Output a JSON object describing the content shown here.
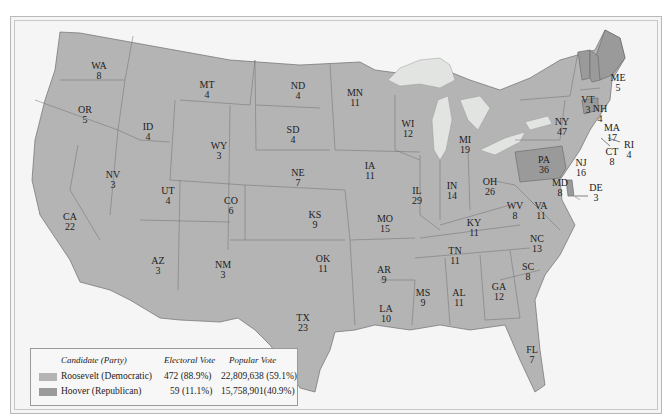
{
  "colors": {
    "roosevelt": "#b4b4b4",
    "hoover": "#9a9a9a",
    "lakes": "#e2e4e2",
    "background": "#f4f5f4",
    "border": "#6e6e6e"
  },
  "legend": {
    "headers": {
      "candidate": "Candidate (Party)",
      "electoral": "Electoral Vote",
      "popular": "Popular Vote"
    },
    "rows": [
      {
        "candidate": "Roosevelt (Democratic)",
        "electoral": "472 (88.9%)",
        "popular": "22,809,638 (59.1%)",
        "color": "#b4b4b4"
      },
      {
        "candidate": "Hoover (Republican)",
        "electoral": "59 (11.1%)",
        "popular": "15,758,901(40.9%)",
        "color": "#9a9a9a"
      }
    ]
  },
  "states": [
    {
      "abbr": "WA",
      "ev": "8",
      "winner": "roosevelt"
    },
    {
      "abbr": "OR",
      "ev": "5",
      "winner": "roosevelt"
    },
    {
      "abbr": "CA",
      "ev": "22",
      "winner": "roosevelt"
    },
    {
      "abbr": "ID",
      "ev": "4",
      "winner": "roosevelt"
    },
    {
      "abbr": "NV",
      "ev": "3",
      "winner": "roosevelt"
    },
    {
      "abbr": "MT",
      "ev": "4",
      "winner": "roosevelt"
    },
    {
      "abbr": "WY",
      "ev": "3",
      "winner": "roosevelt"
    },
    {
      "abbr": "UT",
      "ev": "4",
      "winner": "roosevelt"
    },
    {
      "abbr": "AZ",
      "ev": "3",
      "winner": "roosevelt"
    },
    {
      "abbr": "CO",
      "ev": "6",
      "winner": "roosevelt"
    },
    {
      "abbr": "NM",
      "ev": "3",
      "winner": "roosevelt"
    },
    {
      "abbr": "ND",
      "ev": "4",
      "winner": "roosevelt"
    },
    {
      "abbr": "SD",
      "ev": "4",
      "winner": "roosevelt"
    },
    {
      "abbr": "NE",
      "ev": "7",
      "winner": "roosevelt"
    },
    {
      "abbr": "KS",
      "ev": "9",
      "winner": "roosevelt"
    },
    {
      "abbr": "OK",
      "ev": "11",
      "winner": "roosevelt"
    },
    {
      "abbr": "TX",
      "ev": "23",
      "winner": "roosevelt"
    },
    {
      "abbr": "MN",
      "ev": "11",
      "winner": "roosevelt"
    },
    {
      "abbr": "IA",
      "ev": "11",
      "winner": "roosevelt"
    },
    {
      "abbr": "MO",
      "ev": "15",
      "winner": "roosevelt"
    },
    {
      "abbr": "AR",
      "ev": "9",
      "winner": "roosevelt"
    },
    {
      "abbr": "LA",
      "ev": "10",
      "winner": "roosevelt"
    },
    {
      "abbr": "WI",
      "ev": "12",
      "winner": "roosevelt"
    },
    {
      "abbr": "IL",
      "ev": "29",
      "winner": "roosevelt"
    },
    {
      "abbr": "MI",
      "ev": "19",
      "winner": "roosevelt"
    },
    {
      "abbr": "IN",
      "ev": "14",
      "winner": "roosevelt"
    },
    {
      "abbr": "OH",
      "ev": "26",
      "winner": "roosevelt"
    },
    {
      "abbr": "KY",
      "ev": "11",
      "winner": "roosevelt"
    },
    {
      "abbr": "TN",
      "ev": "11",
      "winner": "roosevelt"
    },
    {
      "abbr": "MS",
      "ev": "9",
      "winner": "roosevelt"
    },
    {
      "abbr": "AL",
      "ev": "11",
      "winner": "roosevelt"
    },
    {
      "abbr": "GA",
      "ev": "12",
      "winner": "roosevelt"
    },
    {
      "abbr": "FL",
      "ev": "7",
      "winner": "roosevelt"
    },
    {
      "abbr": "SC",
      "ev": "8",
      "winner": "roosevelt"
    },
    {
      "abbr": "NC",
      "ev": "13",
      "winner": "roosevelt"
    },
    {
      "abbr": "VA",
      "ev": "11",
      "winner": "roosevelt"
    },
    {
      "abbr": "WV",
      "ev": "8",
      "winner": "roosevelt"
    },
    {
      "abbr": "MD",
      "ev": "8",
      "winner": "roosevelt"
    },
    {
      "abbr": "DE",
      "ev": "3",
      "winner": "hoover"
    },
    {
      "abbr": "PA",
      "ev": "36",
      "winner": "hoover"
    },
    {
      "abbr": "NJ",
      "ev": "16",
      "winner": "roosevelt"
    },
    {
      "abbr": "NY",
      "ev": "47",
      "winner": "roosevelt"
    },
    {
      "abbr": "CT",
      "ev": "8",
      "winner": "hoover"
    },
    {
      "abbr": "RI",
      "ev": "4",
      "winner": "roosevelt"
    },
    {
      "abbr": "MA",
      "ev": "17",
      "winner": "roosevelt"
    },
    {
      "abbr": "VT",
      "ev": "3",
      "winner": "hoover"
    },
    {
      "abbr": "NH",
      "ev": "4",
      "winner": "hoover"
    },
    {
      "abbr": "ME",
      "ev": "5",
      "winner": "hoover"
    }
  ]
}
